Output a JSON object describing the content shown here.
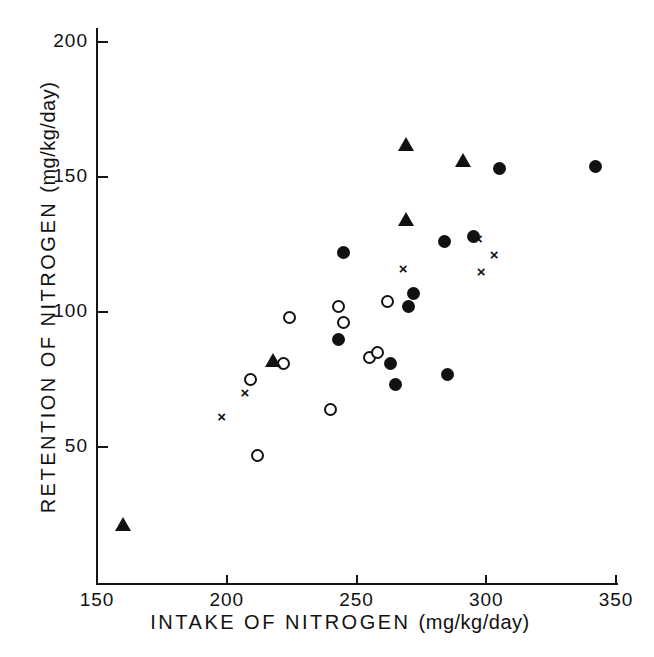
{
  "chart_data": {
    "type": "scatter",
    "title": "",
    "xlabel": "INTAKE OF NITROGEN",
    "xlabel_units": "(mg/kg/day)",
    "ylabel": "RETENTION OF NITROGEN",
    "ylabel_units": "(mg/kg/day)",
    "xlim": [
      150,
      350
    ],
    "ylim": [
      0,
      210
    ],
    "xticks": [
      150,
      200,
      250,
      300,
      350
    ],
    "yticks": [
      50,
      100,
      150,
      200
    ],
    "xtick_labels": [
      "150",
      "200",
      "250",
      "300",
      "350"
    ],
    "ytick_labels": [
      "50",
      "100",
      "150",
      "200"
    ],
    "grid": false,
    "legend": "none",
    "marker_colors": {
      "filled": "#111111",
      "open": "#111111",
      "triangle": "#111111",
      "cross": "#111111"
    },
    "series": [
      {
        "name": "filled-circle",
        "marker": "filled",
        "points": [
          {
            "x": 245,
            "y": 122
          },
          {
            "x": 243,
            "y": 90
          },
          {
            "x": 263,
            "y": 81
          },
          {
            "x": 265,
            "y": 73
          },
          {
            "x": 270,
            "y": 102
          },
          {
            "x": 272,
            "y": 107
          },
          {
            "x": 285,
            "y": 77
          },
          {
            "x": 284,
            "y": 126
          },
          {
            "x": 295,
            "y": 128
          },
          {
            "x": 305,
            "y": 153
          },
          {
            "x": 342,
            "y": 154
          }
        ]
      },
      {
        "name": "open-circle",
        "marker": "open",
        "points": [
          {
            "x": 212,
            "y": 47
          },
          {
            "x": 209,
            "y": 75
          },
          {
            "x": 222,
            "y": 81
          },
          {
            "x": 224,
            "y": 98
          },
          {
            "x": 240,
            "y": 64
          },
          {
            "x": 243,
            "y": 102
          },
          {
            "x": 245,
            "y": 96
          },
          {
            "x": 255,
            "y": 83
          },
          {
            "x": 258,
            "y": 85
          },
          {
            "x": 262,
            "y": 104
          }
        ]
      },
      {
        "name": "triangle",
        "marker": "triangle",
        "points": [
          {
            "x": 160,
            "y": 21
          },
          {
            "x": 218,
            "y": 82
          },
          {
            "x": 269,
            "y": 134
          },
          {
            "x": 269,
            "y": 162
          },
          {
            "x": 291,
            "y": 156
          }
        ]
      },
      {
        "name": "cross",
        "marker": "cross",
        "points": [
          {
            "x": 198,
            "y": 61
          },
          {
            "x": 207,
            "y": 70
          },
          {
            "x": 268,
            "y": 116
          },
          {
            "x": 297,
            "y": 127
          },
          {
            "x": 298,
            "y": 115
          },
          {
            "x": 303,
            "y": 121
          }
        ]
      }
    ]
  },
  "markers": {
    "cross_glyph": "×"
  }
}
